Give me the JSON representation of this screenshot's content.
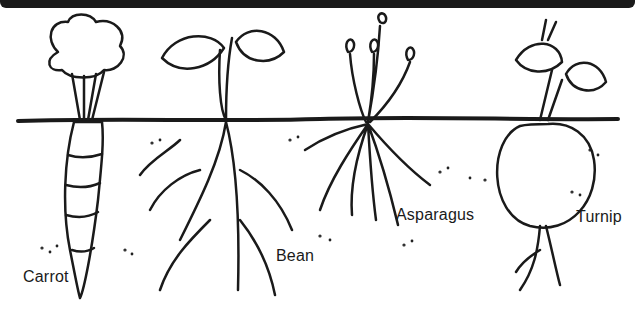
{
  "diagram": {
    "title": "",
    "plants": [
      {
        "name": "Carrot",
        "label": "Carrot"
      },
      {
        "name": "Bean",
        "label": "Bean"
      },
      {
        "name": "Asparagus",
        "label": "Asparagus"
      },
      {
        "name": "Turnip",
        "label": "Turnip"
      }
    ],
    "colors": {
      "ink": "#1a1a1a",
      "background": "#ffffff",
      "topbar": "#1a1a1a"
    }
  }
}
